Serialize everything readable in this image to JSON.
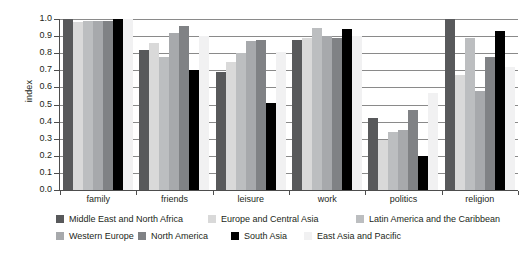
{
  "chart_data": {
    "type": "bar",
    "title": "",
    "subtitle": "",
    "xlabel": "",
    "ylabel": "index",
    "ylim": [
      0.0,
      1.0
    ],
    "grid": true,
    "legend_position": "bottom",
    "categories": [
      "family",
      "friends",
      "leisure",
      "work",
      "politics",
      "religion"
    ],
    "ytick_labels": [
      "1.0",
      "0.9",
      "0.8",
      "0.7",
      "0.6",
      "0.5",
      "0.4",
      "0.3",
      "0.2",
      "0.1",
      "0.0"
    ],
    "ytick_values": [
      1.0,
      0.9,
      0.8,
      0.7,
      0.6,
      0.5,
      0.4,
      0.3,
      0.2,
      0.1,
      0.0
    ],
    "series": [
      {
        "name": "Middle East and North Africa",
        "color": "#58595b",
        "values": [
          1.0,
          0.82,
          0.69,
          0.88,
          0.42,
          1.0
        ]
      },
      {
        "name": "Europe and Central Asia",
        "color": "#d9d9d9",
        "values": [
          0.98,
          0.86,
          0.75,
          0.89,
          0.29,
          0.67
        ]
      },
      {
        "name": "Latin America and the Caribbean",
        "color": "#bcbec0",
        "values": [
          0.99,
          0.78,
          0.8,
          0.95,
          0.34,
          0.89
        ]
      },
      {
        "name": "Western Europe",
        "color": "#a7a9ac",
        "values": [
          0.99,
          0.92,
          0.87,
          0.9,
          0.35,
          0.58
        ]
      },
      {
        "name": "North America",
        "color": "#808285",
        "values": [
          0.99,
          0.96,
          0.88,
          0.89,
          0.47,
          0.78
        ]
      },
      {
        "name": "South Asia",
        "color": "#000000",
        "values": [
          1.0,
          0.7,
          0.51,
          0.94,
          0.2,
          0.93
        ]
      },
      {
        "name": "East Asia and Pacific",
        "color": "#f1f1f2",
        "values": [
          1.0,
          0.9,
          0.81,
          0.9,
          0.57,
          0.72
        ]
      }
    ]
  },
  "legend": {
    "items": [
      {
        "label": "Middle East and North Africa",
        "color": "#58595b"
      },
      {
        "label": "Europe and Central Asia",
        "color": "#d9d9d9"
      },
      {
        "label": "Latin America and the Caribbean",
        "color": "#bcbec0"
      },
      {
        "label": "Western Europe",
        "color": "#a7a9ac"
      },
      {
        "label": "North America",
        "color": "#808285"
      },
      {
        "label": "South Asia",
        "color": "#000000"
      },
      {
        "label": "East Asia and Pacific",
        "color": "#f1f1f2"
      }
    ]
  }
}
